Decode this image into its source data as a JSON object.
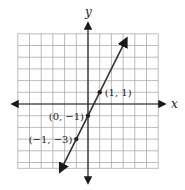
{
  "chart_data": {
    "type": "line",
    "title": "",
    "xlabel": "x",
    "ylabel": "y",
    "xlim": [
      -5,
      6
    ],
    "ylim": [
      -6,
      6
    ],
    "grid": true,
    "equation": "y = 2x - 1",
    "line": {
      "slope": 2,
      "intercept": -1,
      "x_start": -2.4,
      "x_end": 3.3
    },
    "points": [
      {
        "x": 1,
        "y": 1,
        "label": "(1, 1)"
      },
      {
        "x": 0,
        "y": -1,
        "label": "(0, −1)"
      },
      {
        "x": -1,
        "y": -3,
        "label": "(−1, −3)"
      }
    ]
  },
  "axes": {
    "x_label": "x",
    "y_label": "y"
  },
  "colors": {
    "grid": "#9a9a9a",
    "axis": "#1a1a1a",
    "line": "#333333"
  }
}
